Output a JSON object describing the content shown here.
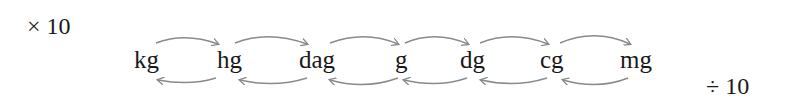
{
  "diagram": {
    "multiply_label": "× 10",
    "divide_label": "÷ 10",
    "units": [
      {
        "label": "kg",
        "x": 134
      },
      {
        "label": "hg",
        "x": 217
      },
      {
        "label": "dag",
        "x": 299
      },
      {
        "label": "g",
        "x": 395
      },
      {
        "label": "dg",
        "x": 460
      },
      {
        "label": "cg",
        "x": 540
      },
      {
        "label": "mg",
        "x": 620
      }
    ],
    "arrow_color": "#8a8a8a",
    "forward_arrows_meaning": "× 10 (to smaller unit)",
    "backward_arrows_meaning": "÷ 10 (to larger unit)"
  }
}
